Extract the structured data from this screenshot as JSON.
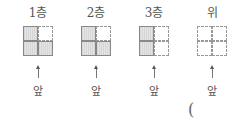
{
  "views": [
    {
      "label": "1층",
      "cells": [
        [
          true,
          false
        ],
        [
          true,
          true
        ]
      ],
      "front_label": "앞"
    },
    {
      "label": "2층",
      "cells": [
        [
          true,
          false
        ],
        [
          true,
          true
        ]
      ],
      "front_label": "앞"
    },
    {
      "label": "3층",
      "cells": [
        [
          true,
          false
        ],
        [
          true,
          false
        ]
      ],
      "front_label": "앞"
    },
    {
      "label": "위",
      "cells": [
        [
          false,
          false
        ],
        [
          false,
          false
        ]
      ],
      "front_label": "앞"
    }
  ],
  "answer_paren": "("
}
